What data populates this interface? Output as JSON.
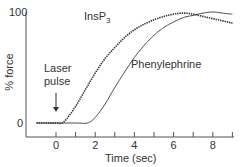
{
  "chart_data": {
    "type": "line",
    "title": "",
    "xlabel": "Time (sec)",
    "ylabel": "% force",
    "xlim": [
      -1.5,
      9
    ],
    "ylim": [
      0,
      100
    ],
    "x_ticks_major": [
      0,
      2,
      4,
      6,
      8
    ],
    "x_ticks_minor": [
      1,
      3,
      5,
      7,
      9
    ],
    "y_tick_labels": [
      "0",
      "100"
    ],
    "grid": false,
    "legend": "none (inline curve labels)",
    "annotations": [
      {
        "text": "Laser pulse",
        "x": 0,
        "arrow": "down",
        "points_to": 0
      }
    ],
    "series": [
      {
        "name": "InsP3",
        "style": "dotted/jagged trace",
        "x": [
          -1,
          -0.5,
          0,
          0.4,
          1,
          1.5,
          2,
          2.5,
          3,
          3.5,
          4,
          4.5,
          5,
          5.5,
          6,
          6.5,
          7,
          7.5,
          8,
          8.5,
          9
        ],
        "y": [
          0,
          0,
          0,
          1,
          15,
          30,
          45,
          58,
          68,
          77,
          84,
          89,
          93,
          96,
          98,
          99,
          98,
          96,
          94,
          92,
          90
        ]
      },
      {
        "name": "Phenylephrine",
        "style": "solid thin line",
        "x": [
          -1,
          0,
          1,
          1.6,
          2,
          2.5,
          3,
          3.5,
          4,
          4.5,
          5,
          5.5,
          6,
          6.5,
          7,
          7.5,
          8,
          8.5,
          9
        ],
        "y": [
          0,
          0,
          0,
          0,
          5,
          17,
          32,
          46,
          59,
          70,
          79,
          86,
          91,
          95,
          97,
          99,
          100,
          99,
          98
        ]
      }
    ]
  },
  "labels": {
    "y_top": "100",
    "y_zero": "0",
    "y_axis_title": "% force",
    "x_axis_title": "Time (sec)",
    "x_ticks": [
      "0",
      "2",
      "4",
      "6",
      "8"
    ],
    "series_insp3": "InsP",
    "series_insp3_sub": "3",
    "series_phenylephrine": "Phenylephrine",
    "annotation_line1": "Laser",
    "annotation_line2": "pulse"
  },
  "colors": {
    "axis": "#555555",
    "trace": "#333333",
    "background": "#ffffff"
  }
}
